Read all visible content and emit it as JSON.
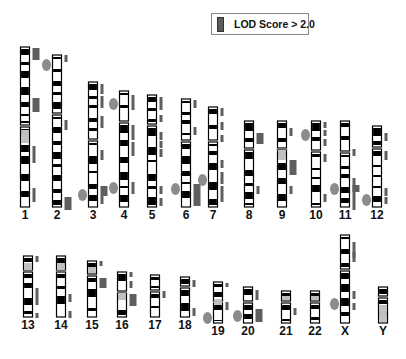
{
  "legend": {
    "label": "LOD Score > 2.0",
    "swatch_color": "#5a5a5a"
  },
  "colors": {
    "band_dark": "#000000",
    "band_light": "#ffffff",
    "band_gray": "#c0c0c0",
    "lod_bar": "#5f5f5f",
    "marker_ellipse": "#8c8c8c",
    "outline": "#000000"
  },
  "chart_data": {
    "type": "ideogram",
    "title": "",
    "legend": [
      "LOD Score > 2.0"
    ],
    "chromosomes": [
      {
        "id": "1",
        "label": "1",
        "x": 25,
        "top": 47,
        "bottom": 207,
        "centromere": 126,
        "lod": [
          [
            48,
            60,
            "wide"
          ],
          [
            98,
            112,
            "wide"
          ],
          [
            146,
            163,
            "thin"
          ],
          [
            188,
            202,
            "thin"
          ]
        ],
        "markers": []
      },
      {
        "id": "2",
        "label": "2",
        "x": 57,
        "top": 55,
        "bottom": 207,
        "centromere": 114,
        "lod": [
          [
            55,
            62,
            "thin"
          ],
          [
            120,
            130,
            "thin"
          ],
          [
            197,
            210,
            "wide"
          ]
        ],
        "markers": [
          65
        ]
      },
      {
        "id": "3",
        "label": "3",
        "x": 93,
        "top": 82,
        "bottom": 207,
        "centromere": 140,
        "lod": [
          [
            84,
            94,
            "thin"
          ],
          [
            96,
            108,
            "thin"
          ],
          [
            116,
            128,
            "thin"
          ],
          [
            150,
            160,
            "thin"
          ],
          [
            186,
            196,
            "wide"
          ],
          [
            196,
            204,
            "thin"
          ]
        ],
        "markers": [
          195
        ]
      },
      {
        "id": "4",
        "label": "4",
        "x": 124,
        "top": 91,
        "bottom": 207,
        "centromere": 122,
        "lod": [
          [
            95,
            110,
            "thin"
          ],
          [
            125,
            140,
            "thin"
          ],
          [
            142,
            156,
            "thin"
          ],
          [
            182,
            194,
            "thin"
          ]
        ],
        "markers": [
          104,
          188
        ]
      },
      {
        "id": "5",
        "label": "5",
        "x": 152,
        "top": 95,
        "bottom": 207,
        "centromere": 125,
        "lod": [
          [
            97,
            110,
            "thin"
          ],
          [
            115,
            122,
            "thin"
          ],
          [
            132,
            140,
            "thin"
          ],
          [
            141,
            148,
            "thin"
          ],
          [
            149,
            157,
            "thin"
          ],
          [
            186,
            194,
            "thin"
          ],
          [
            198,
            206,
            "thin"
          ]
        ],
        "markers": []
      },
      {
        "id": "6",
        "label": "6",
        "x": 186,
        "top": 99,
        "bottom": 207,
        "centromere": 141,
        "lod": [
          [
            100,
            108,
            "thin"
          ],
          [
            127,
            135,
            "thin"
          ],
          [
            184,
            206,
            "wide"
          ]
        ],
        "markers": [
          189
        ]
      },
      {
        "id": "7",
        "label": "7",
        "x": 213,
        "top": 107,
        "bottom": 207,
        "centromere": 141,
        "lod": [
          [
            108,
            116,
            "thin"
          ],
          [
            122,
            130,
            "thin"
          ],
          [
            135,
            142,
            "thin"
          ],
          [
            160,
            168,
            "thin"
          ],
          [
            172,
            184,
            "thin"
          ],
          [
            186,
            202,
            "thin"
          ]
        ],
        "markers": [
          180
        ]
      },
      {
        "id": "8",
        "label": "8",
        "x": 249,
        "top": 121,
        "bottom": 207,
        "centromere": 149,
        "lod": [
          [
            133,
            144,
            "wide"
          ],
          [
            186,
            194,
            "thin"
          ]
        ],
        "markers": []
      },
      {
        "id": "9",
        "label": "9",
        "x": 282,
        "top": 121,
        "bottom": 207,
        "centromere": 149,
        "lod": [
          [
            128,
            136,
            "thin"
          ],
          [
            160,
            175,
            "wide"
          ],
          [
            186,
            194,
            "thin"
          ]
        ],
        "markers": []
      },
      {
        "id": "10",
        "label": "10",
        "x": 316,
        "top": 121,
        "bottom": 207,
        "centromere": 151,
        "lod": [
          [
            122,
            128,
            "thin"
          ],
          [
            130,
            136,
            "thin"
          ],
          [
            139,
            146,
            "thin"
          ],
          [
            154,
            162,
            "thin"
          ],
          [
            194,
            202,
            "thin"
          ]
        ],
        "markers": [
          135
        ]
      },
      {
        "id": "11",
        "label": "11",
        "x": 345,
        "top": 121,
        "bottom": 207,
        "centromere": 152,
        "lod": [
          [
            149,
            156,
            "thin"
          ],
          [
            178,
            210,
            "thin"
          ],
          [
            185,
            192,
            "wide"
          ]
        ],
        "markers": [
          189
        ]
      },
      {
        "id": "12",
        "label": "12",
        "x": 377,
        "top": 126,
        "bottom": 207,
        "centromere": 148,
        "lod": [
          [
            133,
            141,
            "thin"
          ],
          [
            151,
            160,
            "thin"
          ],
          [
            188,
            196,
            "thin"
          ],
          [
            197,
            204,
            "thin"
          ]
        ],
        "markers": [
          200
        ]
      },
      {
        "id": "13",
        "label": "13",
        "x": 28,
        "top": 256,
        "bottom": 317,
        "centromere": 271,
        "lod": [
          [
            256,
            262,
            "thin"
          ],
          [
            288,
            305,
            "thin"
          ],
          [
            313,
            318,
            "thin"
          ]
        ],
        "markers": []
      },
      {
        "id": "14",
        "label": "14",
        "x": 61,
        "top": 256,
        "bottom": 317,
        "centromere": 271,
        "lod": [
          [
            294,
            302,
            "thin"
          ],
          [
            311,
            318,
            "thin"
          ]
        ],
        "markers": []
      },
      {
        "id": "15",
        "label": "15",
        "x": 92,
        "top": 261,
        "bottom": 317,
        "centromere": 275,
        "lod": [
          [
            261,
            266,
            "thin"
          ],
          [
            278,
            288,
            "wide"
          ]
        ],
        "markers": []
      },
      {
        "id": "16",
        "label": "16",
        "x": 122,
        "top": 272,
        "bottom": 317,
        "centromere": 292,
        "lod": [
          [
            272,
            277,
            "thin"
          ],
          [
            281,
            288,
            "thin"
          ],
          [
            294,
            306,
            "wide"
          ]
        ],
        "markers": []
      },
      {
        "id": "17",
        "label": "17",
        "x": 155,
        "top": 275,
        "bottom": 317,
        "centromere": 291,
        "lod": [
          [
            291,
            298,
            "thin"
          ]
        ],
        "markers": []
      },
      {
        "id": "18",
        "label": "18",
        "x": 185,
        "top": 277,
        "bottom": 317,
        "centromere": 287,
        "lod": [
          [
            280,
            287,
            "thin"
          ],
          [
            308,
            316,
            "thin"
          ]
        ],
        "markers": []
      },
      {
        "id": "19",
        "label": "19",
        "x": 218,
        "top": 282,
        "bottom": 323,
        "centromere": 302,
        "lod": [
          [
            283,
            287,
            "thin"
          ],
          [
            302,
            310,
            "thin"
          ]
        ],
        "markers": [
          318
        ]
      },
      {
        "id": "20",
        "label": "20",
        "x": 248,
        "top": 287,
        "bottom": 323,
        "centromere": 302,
        "lod": [
          [
            290,
            300,
            "thin"
          ],
          [
            309,
            322,
            "wide"
          ]
        ],
        "markers": [
          316
        ]
      },
      {
        "id": "21",
        "label": "21",
        "x": 286,
        "top": 291,
        "bottom": 323,
        "centromere": 302,
        "lod": [
          [
            308,
            315,
            "thin"
          ]
        ],
        "markers": []
      },
      {
        "id": "22",
        "label": "22",
        "x": 315,
        "top": 291,
        "bottom": 323,
        "centromere": 302,
        "lod": [],
        "markers": []
      },
      {
        "id": "X",
        "label": "X",
        "x": 345,
        "top": 235,
        "bottom": 323,
        "centromere": 270,
        "lod": [
          [
            242,
            258,
            "thin"
          ],
          [
            252,
            262,
            "thin"
          ],
          [
            291,
            299,
            "thin"
          ],
          [
            303,
            310,
            "thin"
          ]
        ],
        "markers": [
          304
        ]
      },
      {
        "id": "Y",
        "label": "Y",
        "x": 383,
        "top": 287,
        "bottom": 323,
        "centromere": 297,
        "lod": [],
        "markers": []
      }
    ]
  }
}
